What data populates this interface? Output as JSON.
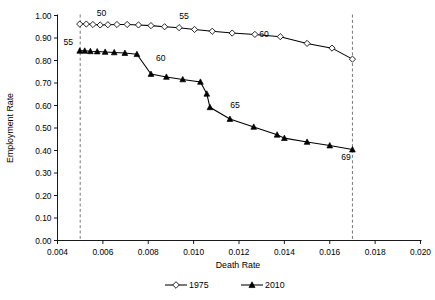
{
  "chart_data": {
    "type": "line",
    "title": "",
    "xlabel": "Death Rate",
    "ylabel": "Employment Rate",
    "xlim": [
      0.004,
      0.02
    ],
    "ylim": [
      0.0,
      1.0
    ],
    "xticks": [
      "0.004",
      "0.006",
      "0.008",
      "0.010",
      "0.012",
      "0.014",
      "0.016",
      "0.018",
      "0.020"
    ],
    "xtick_values": [
      0.004,
      0.006,
      0.008,
      0.01,
      0.012,
      0.014,
      0.016,
      0.018,
      0.02
    ],
    "yticks": [
      "0.00",
      "0.10",
      "0.20",
      "0.30",
      "0.40",
      "0.50",
      "0.60",
      "0.70",
      "0.80",
      "0.90",
      "1.00"
    ],
    "ytick_values": [
      0.0,
      0.1,
      0.2,
      0.3,
      0.4,
      0.5,
      0.6,
      0.7,
      0.8,
      0.9,
      1.0
    ],
    "grid": false,
    "legend_position": "below-axis",
    "reference_lines": [
      {
        "name": "left-dashed-reference",
        "x": 0.005,
        "style": "dashed"
      },
      {
        "name": "right-dashed-reference",
        "x": 0.017,
        "style": "dashed"
      }
    ],
    "series": [
      {
        "name": "1975",
        "marker": "open-diamond",
        "x": [
          0.00498,
          0.00527,
          0.00556,
          0.00588,
          0.00622,
          0.00662,
          0.00707,
          0.00757,
          0.00812,
          0.00872,
          0.00936,
          0.01004,
          0.01082,
          0.0117,
          0.0127,
          0.01382,
          0.015,
          0.0161,
          0.017
        ],
        "y": [
          0.962,
          0.962,
          0.96,
          0.958,
          0.959,
          0.96,
          0.96,
          0.958,
          0.955,
          0.95,
          0.946,
          0.938,
          0.93,
          0.922,
          0.916,
          0.906,
          0.876,
          0.855,
          0.806
        ]
      },
      {
        "name": "2010",
        "marker": "filled-triangle",
        "x": [
          0.00498,
          0.0052,
          0.00545,
          0.00575,
          0.0061,
          0.0065,
          0.00697,
          0.0075,
          0.00812,
          0.0088,
          0.00952,
          0.0103,
          0.01058,
          0.01072,
          0.0116,
          0.01265,
          0.01368,
          0.014,
          0.015,
          0.016,
          0.017
        ],
        "y": [
          0.843,
          0.843,
          0.841,
          0.84,
          0.838,
          0.836,
          0.833,
          0.828,
          0.74,
          0.727,
          0.716,
          0.705,
          0.652,
          0.592,
          0.54,
          0.505,
          0.47,
          0.455,
          0.438,
          0.422,
          0.404
        ]
      }
    ],
    "annotations": [
      {
        "text": "50",
        "series": "1975",
        "x": 0.00594,
        "y": 1.0
      },
      {
        "text": "55",
        "series": "1975",
        "x": 0.00958,
        "y": 0.985
      },
      {
        "text": "60",
        "series": "1975",
        "x": 0.0131,
        "y": 0.905
      },
      {
        "text": "55",
        "series": "2010",
        "x": 0.00448,
        "y": 0.868
      },
      {
        "text": "60",
        "series": "2010",
        "x": 0.00855,
        "y": 0.8
      },
      {
        "text": "65",
        "series": "2010",
        "x": 0.01182,
        "y": 0.588
      },
      {
        "text": "69",
        "series": "2010",
        "x": 0.01672,
        "y": 0.356
      }
    ]
  },
  "legend": {
    "entries": [
      {
        "label": "1975",
        "marker": "open-diamond"
      },
      {
        "label": "2010",
        "marker": "filled-triangle"
      }
    ]
  }
}
